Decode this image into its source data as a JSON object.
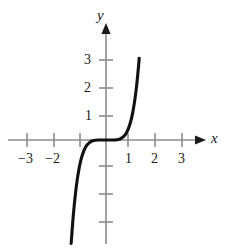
{
  "figure": {
    "background_color": "#ffffff",
    "axis_color": "#8c8c8c",
    "arrow_color": "#1a1a1a",
    "curve_color": "#111111",
    "label_color": "#1a1a1a"
  },
  "axis_names": {
    "x": "x",
    "y": "y"
  },
  "chart_data": {
    "type": "line",
    "title": "",
    "subtitle": "",
    "xlabel": "x",
    "ylabel": "y",
    "grid": false,
    "legend": null,
    "annotations": [],
    "xlim": [
      -3.9,
      4.1
    ],
    "ylim": [
      -3.9,
      3.9
    ],
    "x_ticks": [
      -3,
      -2,
      -1,
      1,
      2,
      3
    ],
    "x_tick_labels": [
      "−3",
      "−2",
      "",
      "1",
      "2",
      "3"
    ],
    "y_ticks": [
      -3,
      -2,
      -1,
      1,
      2,
      3
    ],
    "y_tick_labels": [
      "",
      "",
      "",
      "1",
      "2",
      "3"
    ],
    "function": "y = x^5",
    "series": [
      {
        "name": "y = x^5",
        "x": [
          -1.42,
          -1.36,
          -1.3,
          -1.24,
          -1.18,
          -1.12,
          -1.06,
          -1.0,
          -0.94,
          -0.88,
          -0.82,
          -0.76,
          -0.7,
          -0.64,
          -0.58,
          -0.52,
          -0.46,
          -0.4,
          -0.3,
          -0.2,
          -0.1,
          0.0,
          0.1,
          0.2,
          0.3,
          0.4,
          0.46,
          0.52,
          0.58,
          0.64,
          0.7,
          0.76,
          0.82,
          0.88,
          0.94,
          1.0,
          1.06,
          1.12,
          1.18,
          1.24,
          1.3,
          1.36,
          1.42
        ],
        "y": [
          -5.79,
          -4.65,
          -3.71,
          -2.93,
          -2.29,
          -1.76,
          -1.34,
          -1.0,
          -0.73,
          -0.53,
          -0.37,
          -0.25,
          -0.17,
          -0.11,
          -0.066,
          -0.038,
          -0.021,
          -0.01,
          -0.0024,
          -0.0003,
          0.0,
          0.0,
          0.0,
          0.0003,
          0.0024,
          0.01,
          0.021,
          0.038,
          0.066,
          0.11,
          0.17,
          0.25,
          0.37,
          0.53,
          0.73,
          1.0,
          1.34,
          1.76,
          2.29,
          2.93,
          3.71,
          4.65,
          5.79
        ]
      }
    ]
  },
  "labels": {
    "x_neg3": "−3",
    "x_neg2": "−2",
    "x_pos1": "1",
    "x_pos2": "2",
    "x_pos3": "3",
    "y_pos1": "1",
    "y_pos2": "2",
    "y_pos3": "3"
  }
}
